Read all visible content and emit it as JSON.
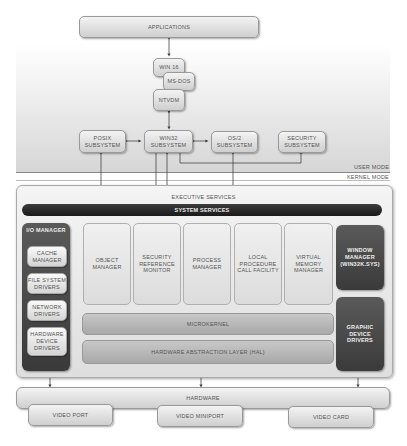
{
  "diagram": {
    "top": {
      "applications": "APPLICATIONS",
      "win16": "WIN 16",
      "msdos": "MS-DOS",
      "ntvdm": "NTVDM"
    },
    "subsystems": {
      "posix": "POSIX SUBSYSTEM",
      "win32": "WIN32 SUBSYSTEM",
      "os2": "OS/2 SUBSYSTEM",
      "security": "SECURITY SUBSYSTEM"
    },
    "modes": {
      "user": "USER MODE",
      "kernel": "KERNEL MODE"
    },
    "executive": {
      "title": "EXECUTIVE SERVICES",
      "system_services": "SYSTEM SERVICES",
      "io_manager": {
        "title": "I/O MANAGER",
        "items": [
          "CACHE MANAGER",
          "FILE SYSTEM DRIVERS",
          "NETWORK DRIVERS",
          "HARDWARE DEVICE DRIVERS"
        ]
      },
      "components": [
        "OBJECT MANAGER",
        "SECURITY REFERENCE MONITOR",
        "PROCESS MANAGER",
        "LOCAL PROCEDURE CALL FACILITY",
        "VIRTUAL MEMORY MANAGER"
      ],
      "window_manager": "WINDOW MANAGER (WIN32K.SYS)",
      "graphic_drivers": "GRAPHIC DEVICE DRIVERS",
      "microkernel": "MICROKERNEL",
      "hal": "HARDWARE ABSTRACTION LAYER (HAL)"
    },
    "hardware": {
      "title": "HARDWARE",
      "items": [
        "VIDEO PORT",
        "VIDEO MINIPORT",
        "VIDEO CARD"
      ]
    }
  }
}
